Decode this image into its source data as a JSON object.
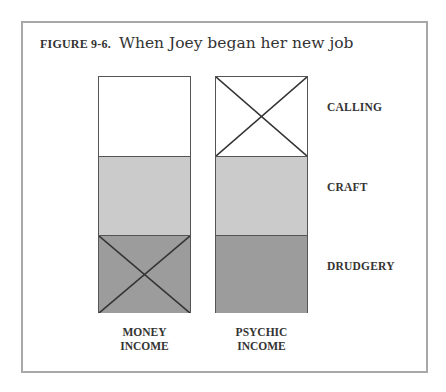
{
  "figure": {
    "number_label": "FIGURE 9-6.",
    "title": "When Joey began her new job"
  },
  "rows": [
    {
      "label": "CALLING"
    },
    {
      "label": "CRAFT"
    },
    {
      "label": "DRUDGERY"
    }
  ],
  "columns": [
    {
      "label_line1": "MONEY",
      "label_line2": "INCOME",
      "crossed_segment": "DRUDGERY"
    },
    {
      "label_line1": "PSYCHIC",
      "label_line2": "INCOME",
      "crossed_segment": "CALLING"
    }
  ],
  "colors": {
    "calling": "#ffffff",
    "craft": "#cbcbcb",
    "drudgery": "#9c9c9c",
    "frame": "#a8a8a8"
  }
}
